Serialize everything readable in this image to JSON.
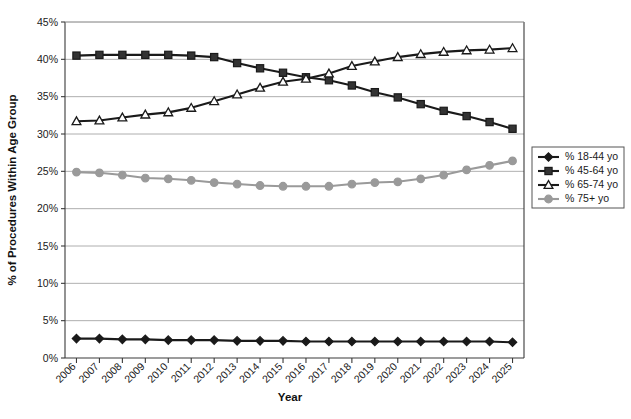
{
  "chart_data": {
    "type": "line",
    "title": "",
    "xlabel": "Year",
    "ylabel": "% of Procedures Within Age Group",
    "categories": [
      "2006",
      "2007",
      "2008",
      "2009",
      "2010",
      "2011",
      "2012",
      "2013",
      "2014",
      "2015",
      "2016",
      "2017",
      "2018",
      "2019",
      "2020",
      "2021",
      "2022",
      "2023",
      "2024",
      "2025"
    ],
    "ylim": [
      0,
      45
    ],
    "ytick_labels": [
      "0%",
      "5%",
      "10%",
      "15%",
      "20%",
      "25%",
      "30%",
      "35%",
      "40%",
      "45%"
    ],
    "ytick_values": [
      0,
      5,
      10,
      15,
      20,
      25,
      30,
      35,
      40,
      45
    ],
    "grid": true,
    "grid_axis": "y",
    "legend_position": "right",
    "series": [
      {
        "name": "% 18-44 yo",
        "marker": "diamond",
        "color": "#1a1a1a",
        "marker_fill": "#1a1a1a",
        "values": [
          2.6,
          2.6,
          2.5,
          2.5,
          2.4,
          2.4,
          2.4,
          2.3,
          2.3,
          2.3,
          2.2,
          2.2,
          2.2,
          2.2,
          2.2,
          2.2,
          2.2,
          2.2,
          2.2,
          2.1
        ]
      },
      {
        "name": "% 45-64 yo",
        "marker": "square",
        "color": "#1a1a1a",
        "marker_fill": "#333333",
        "values": [
          40.5,
          40.6,
          40.6,
          40.6,
          40.6,
          40.5,
          40.3,
          39.5,
          38.8,
          38.2,
          37.6,
          37.2,
          36.5,
          35.6,
          34.9,
          34.0,
          33.1,
          32.4,
          31.6,
          30.7
        ]
      },
      {
        "name": "% 65-74 yo",
        "marker": "triangle",
        "color": "#1a1a1a",
        "marker_fill": "#ffffff",
        "values": [
          31.7,
          31.8,
          32.2,
          32.6,
          32.9,
          33.5,
          34.4,
          35.3,
          36.2,
          37.0,
          37.4,
          38.1,
          39.1,
          39.7,
          40.3,
          40.7,
          41.0,
          41.2,
          41.3,
          41.5
        ]
      },
      {
        "name": "% 75+ yo",
        "marker": "circle",
        "color": "#9a9a9a",
        "marker_fill": "#9a9a9a",
        "values": [
          24.9,
          24.8,
          24.5,
          24.1,
          24.0,
          23.8,
          23.5,
          23.3,
          23.1,
          23.0,
          23.0,
          23.0,
          23.3,
          23.5,
          23.6,
          24.0,
          24.5,
          25.2,
          25.8,
          26.4
        ]
      }
    ]
  }
}
